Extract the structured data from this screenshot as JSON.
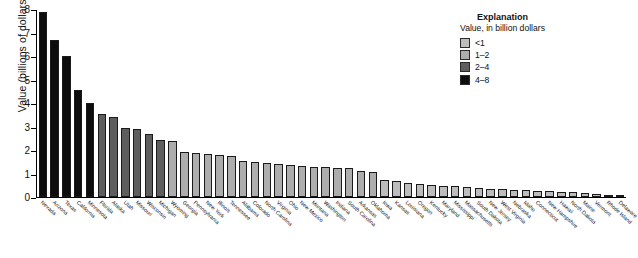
{
  "chart_data": {
    "type": "bar",
    "title": "",
    "xlabel": "",
    "ylabel": "Value (billions of dollars)",
    "ylim": [
      0,
      8
    ],
    "yticks": [
      0,
      1,
      2,
      3,
      4,
      5,
      6,
      7,
      8
    ],
    "ytick_labels": [
      "0",
      "1",
      "2",
      "3",
      "4",
      "5",
      "6",
      "7",
      "8"
    ],
    "grid": false,
    "legend_position": "top-right",
    "categories": [
      "Nevada",
      "Arizona",
      "Texas",
      "California",
      "Minnesota",
      "Florida",
      "Alaska",
      "Utah",
      "Missouri",
      "Wisconsin",
      "Michigan",
      "Wyoming",
      "Georgia",
      "Pennsylvania",
      "New York",
      "Illinois",
      "Tennessee",
      "Alabama",
      "Colorado",
      "North Carolina",
      "Virginia",
      "Ohio",
      "New Mexico",
      "Montana",
      "Washington",
      "Indiana",
      "South Carolina",
      "Arkansas",
      "Oklahoma",
      "Iowa",
      "Kansas",
      "Louisiana",
      "Oregon",
      "Kentucky",
      "Maryland",
      "Mississippi",
      "Massachusetts",
      "South Dakota",
      "New Jersey",
      "West Virginia",
      "Nebraska",
      "Idaho",
      "Connecticut",
      "New Hampshire",
      "Hawaii",
      "North Dakota",
      "Maine",
      "Vermont",
      "Rhode Island",
      "Delaware"
    ],
    "values": [
      7.9,
      6.7,
      6.05,
      4.58,
      4.03,
      3.54,
      3.42,
      2.95,
      2.92,
      2.7,
      2.44,
      2.4,
      1.93,
      1.88,
      1.84,
      1.79,
      1.76,
      1.52,
      1.5,
      1.44,
      1.43,
      1.38,
      1.34,
      1.3,
      1.28,
      1.25,
      1.22,
      1.1,
      1.05,
      0.74,
      0.68,
      0.62,
      0.57,
      0.52,
      0.48,
      0.45,
      0.42,
      0.38,
      0.35,
      0.33,
      0.3,
      0.28,
      0.26,
      0.24,
      0.22,
      0.2,
      0.17,
      0.14,
      0.1,
      0.05
    ],
    "bin_index": [
      3,
      3,
      3,
      3,
      3,
      2,
      2,
      2,
      2,
      2,
      2,
      1,
      1,
      1,
      1,
      1,
      1,
      1,
      1,
      1,
      1,
      1,
      1,
      1,
      1,
      1,
      1,
      1,
      1,
      0,
      0,
      0,
      0,
      0,
      0,
      0,
      0,
      0,
      0,
      0,
      0,
      0,
      0,
      0,
      0,
      0,
      0,
      0,
      0,
      0
    ]
  },
  "legend": {
    "title": "Explanation",
    "subtitle": "Value, in billion dollars",
    "items": [
      {
        "label": "<1",
        "color": "#bdbdbd"
      },
      {
        "label": "1–2",
        "color": "#adadad"
      },
      {
        "label": "2–4",
        "color": "#5e5e5e"
      },
      {
        "label": "4–8",
        "color": "#0d0d0d"
      }
    ]
  }
}
